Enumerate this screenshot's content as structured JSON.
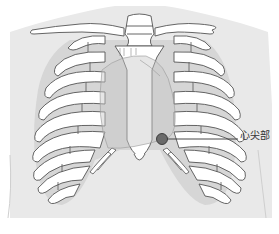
{
  "diagram": {
    "annotations": [
      {
        "id": "apex",
        "label": "心尖部",
        "meaning": "cardiac apex"
      }
    ],
    "colors": {
      "background": "#ffffff",
      "body": "#e9e9e9",
      "intercostal": "#d6d6d6",
      "rib_fill": "#ffffff",
      "outline": "#555555",
      "heart": "#cfcfcf",
      "marker": "#6a6a6a",
      "leader_line": "#333333"
    }
  }
}
